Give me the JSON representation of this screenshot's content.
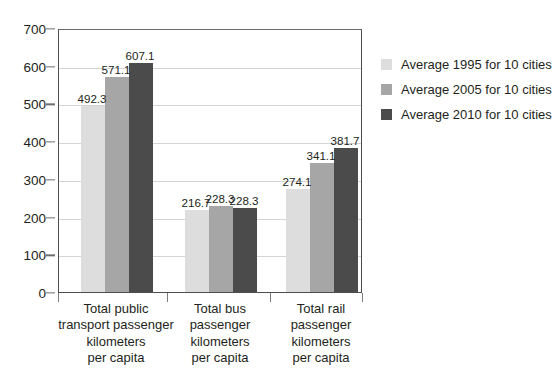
{
  "chart_data": {
    "type": "bar",
    "title": "",
    "xlabel": "",
    "ylabel": "",
    "ylim": [
      0,
      700
    ],
    "ytick_step": 100,
    "yticks": [
      "0",
      "100",
      "200",
      "300",
      "400",
      "500",
      "600",
      "700"
    ],
    "grid": true,
    "legend_position": "right",
    "categories": [
      "Total public\ntransport passenger\nkilometers\nper capita",
      "Total bus\npassenger\nkilometers\nper capita",
      "Total rail\npassenger\nkilometers\nper capita"
    ],
    "series": [
      {
        "name": "Average 1995 for 10 cities",
        "color": "#dddddd",
        "values": [
          492.3,
          216.7,
          274.1
        ],
        "labels": [
          "492.3",
          "216.7",
          "274.1"
        ]
      },
      {
        "name": "Average 2005 for 10 cities",
        "color": "#a6a6a6",
        "values": [
          571.1,
          228.3,
          341.1
        ],
        "labels": [
          "571.1",
          "228.3",
          "341.1"
        ]
      },
      {
        "name": "Average 2010 for 10 cities",
        "color": "#4b4b4b",
        "values": [
          607.1,
          223.4,
          381.7
        ],
        "labels": [
          "607.1",
          "228.3",
          "381.7"
        ]
      }
    ]
  },
  "legend": {
    "items": [
      {
        "label": "Average 1995 for 10 cities"
      },
      {
        "label": "Average 2005 for 10 cities"
      },
      {
        "label": "Average 2010 for 10 cities"
      }
    ]
  }
}
